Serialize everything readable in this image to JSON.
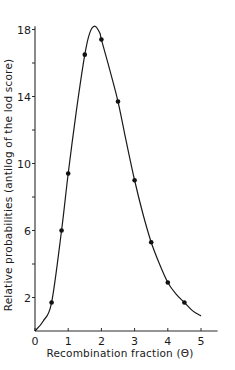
{
  "chart_data": {
    "type": "line",
    "title": "",
    "xlabel": "Recombination fraction (Θ)",
    "ylabel": "Relative probabilities (antilog of the lod score)",
    "xlim": [
      0,
      5.5
    ],
    "ylim": [
      0,
      18.2
    ],
    "grid": false,
    "legend": null,
    "x_ticks": [
      0,
      1,
      2,
      3,
      4,
      5
    ],
    "x_tick_labels": [
      "0",
      "1",
      "2",
      "3",
      "4",
      "5"
    ],
    "y_ticks": [
      2,
      4,
      6,
      8,
      10,
      12,
      14,
      16,
      18
    ],
    "y_tick_labels": [
      "2",
      "",
      "6",
      "",
      "10",
      "",
      "14",
      "",
      "18"
    ],
    "series": [
      {
        "name": "data points",
        "marker": "filled-circle",
        "x": [
          0.5,
          0.8,
          1.0,
          1.5,
          2.0,
          2.5,
          3.0,
          3.5,
          4.0,
          4.5
        ],
        "y": [
          1.7,
          6.0,
          9.4,
          16.5,
          17.4,
          13.7,
          9.0,
          5.3,
          2.9,
          1.7
        ]
      },
      {
        "name": "fitted curve",
        "marker": "none",
        "x": [
          0.0,
          0.25,
          0.5,
          0.8,
          1.0,
          1.25,
          1.5,
          1.65,
          1.8,
          1.95,
          2.0,
          2.25,
          2.5,
          2.75,
          3.0,
          3.25,
          3.5,
          3.75,
          4.0,
          4.25,
          4.5,
          4.75,
          5.0
        ],
        "y": [
          0.0,
          0.6,
          1.7,
          6.0,
          9.4,
          13.2,
          16.5,
          17.8,
          18.2,
          17.8,
          17.4,
          15.6,
          13.7,
          11.3,
          9.0,
          7.0,
          5.3,
          4.0,
          2.9,
          2.2,
          1.7,
          1.2,
          0.9
        ]
      }
    ]
  }
}
